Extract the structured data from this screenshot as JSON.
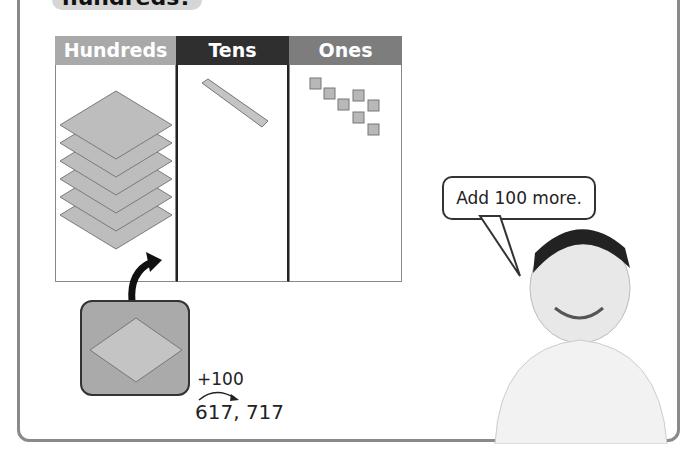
{
  "heading": {
    "text": "hundreds?"
  },
  "place_value_chart": {
    "columns": [
      {
        "label": "Hundreds",
        "color": "#a9a9a9",
        "blocks": 6,
        "block_type": "hundred-flat"
      },
      {
        "label": "Tens",
        "color": "#2f2f2f",
        "blocks": 1,
        "block_type": "ten-rod"
      },
      {
        "label": "Ones",
        "color": "#7d7d7d",
        "blocks": 7,
        "block_type": "unit-cube"
      }
    ]
  },
  "speech_bubble": {
    "text": "Add 100 more."
  },
  "added_block": {
    "block_type": "hundred-flat",
    "count": 1
  },
  "equation": {
    "increment": "+100",
    "sequence": "617, 717"
  }
}
